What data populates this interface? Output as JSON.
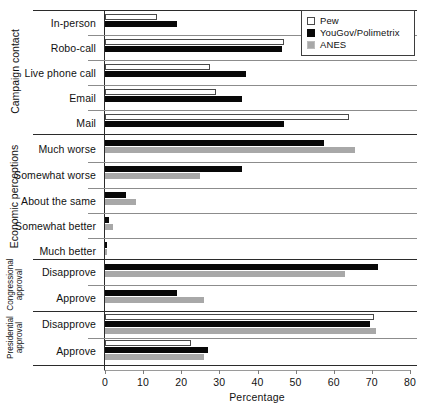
{
  "chart_data": {
    "type": "bar",
    "orientation": "horizontal",
    "title": "",
    "xlabel": "Percentage",
    "ylabel": "",
    "xlim": [
      0,
      80
    ],
    "xticks": [
      0,
      10,
      20,
      30,
      40,
      50,
      60,
      70,
      80
    ],
    "grid": false,
    "legend_position": "top-right",
    "series": [
      {
        "name": "Pew",
        "color": "#ffffff",
        "style": "white-outline"
      },
      {
        "name": "YouGov/Polimetrix",
        "color": "#080808",
        "style": "black"
      },
      {
        "name": "ANES",
        "color": "#a8a8a8",
        "style": "gray"
      }
    ],
    "panels": [
      {
        "group": "Campaign contact",
        "categories": [
          "In-person",
          "Robo-call",
          "Live phone call",
          "Email",
          "Mail"
        ],
        "values": {
          "Pew": [
            13.6,
            47.0,
            27.5,
            29.0,
            64.0
          ],
          "YouGov/Polimetrix": [
            19.0,
            46.5,
            37.0,
            36.0,
            47.0
          ],
          "ANES": [
            null,
            null,
            null,
            null,
            null
          ]
        }
      },
      {
        "group": "Economic perceptions",
        "categories": [
          "Much worse",
          "Somewhat worse",
          "About the same",
          "Somewhat better",
          "Much better"
        ],
        "values": {
          "Pew": [
            null,
            null,
            null,
            null,
            null
          ],
          "YouGov/Polimetrix": [
            57.5,
            36.0,
            5.5,
            1.0,
            0.6
          ],
          "ANES": [
            65.5,
            25.0,
            8.0,
            2.0,
            0.4
          ]
        }
      },
      {
        "group": "Congressional approval",
        "categories": [
          "Disapprove",
          "Approve"
        ],
        "values": {
          "Pew": [
            null,
            null
          ],
          "YouGov/Polimetrix": [
            71.5,
            19.0
          ],
          "ANES": [
            63.0,
            26.0
          ]
        }
      },
      {
        "group": "Presidential approval",
        "categories": [
          "Disapprove",
          "Approve"
        ],
        "values": {
          "Pew": [
            70.5,
            22.5
          ],
          "YouGov/Polimetrix": [
            69.5,
            27.0
          ],
          "ANES": [
            71.0,
            26.0
          ]
        }
      }
    ]
  },
  "legend": {
    "items": [
      {
        "label": "Pew",
        "swatch": "pew"
      },
      {
        "label": "YouGov/Polimetrix",
        "swatch": "yougov"
      },
      {
        "label": "ANES",
        "swatch": "anes"
      }
    ]
  },
  "axis": {
    "xlabel": "Percentage",
    "ticks": [
      "0",
      "10",
      "20",
      "30",
      "40",
      "50",
      "60",
      "70",
      "80"
    ]
  },
  "groups": {
    "campaign_contact": "Campaign contact",
    "economic_perceptions": "Economic perceptions",
    "congressional_approval": "Congressional approval",
    "presidential_approval": "Presidential approval"
  },
  "categories": {
    "in_person": "In-person",
    "robo_call": "Robo-call",
    "live_phone_call": "Live phone call",
    "email": "Email",
    "mail": "Mail",
    "much_worse": "Much worse",
    "somewhat_worse": "Somewhat worse",
    "about_the_same": "About the same",
    "somewhat_better": "Somewhat better",
    "much_better": "Much better",
    "cong_disapprove": "Disapprove",
    "cong_approve": "Approve",
    "pres_disapprove": "Disapprove",
    "pres_approve": "Approve"
  }
}
